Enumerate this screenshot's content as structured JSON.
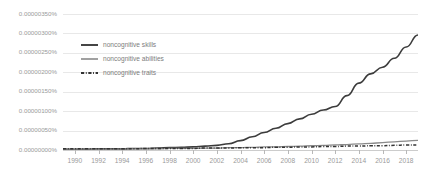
{
  "chart_data": {
    "type": "line",
    "title": "",
    "subtitle": "",
    "xlabel": "",
    "ylabel": "",
    "grid": true,
    "legend_position": "top-left-inside",
    "xlim": [
      1989,
      2019
    ],
    "ylim": [
      0.0,
      3.5e-06
    ],
    "yticks": [
      0.0,
      5e-07,
      1e-06,
      1.5e-06,
      2e-06,
      2.5e-06,
      3e-06,
      3.5e-06
    ],
    "ytick_labels": [
      "0.00000000%",
      "0.00000050%",
      "0.00000100%",
      "0.00000150%",
      "0.00000200%",
      "0.00000250%",
      "0.00000300%",
      "0.00000350%"
    ],
    "xticks": [
      1990,
      1992,
      1994,
      1996,
      1998,
      2000,
      2002,
      2004,
      2006,
      2008,
      2010,
      2012,
      2014,
      2016,
      2018
    ],
    "xtick_labels": [
      "1990",
      "1992",
      "1994",
      "1996",
      "1998",
      "2000",
      "2002",
      "2004",
      "2006",
      "2008",
      "2010",
      "2012",
      "2014",
      "2016",
      "2018"
    ],
    "x": [
      1989,
      1990,
      1991,
      1992,
      1993,
      1994,
      1995,
      1996,
      1997,
      1998,
      1999,
      2000,
      2001,
      2002,
      2003,
      2004,
      2005,
      2006,
      2007,
      2008,
      2009,
      2010,
      2011,
      2012,
      2013,
      2014,
      2015,
      2016,
      2017,
      2018,
      2019
    ],
    "series": [
      {
        "name": "noncognitive skills",
        "color": "#3c3c3c",
        "width": 1.6,
        "dash": "none",
        "values": [
          2e-08,
          2e-08,
          2e-08,
          3e-08,
          3e-08,
          3e-08,
          4e-08,
          4e-08,
          5e-08,
          6e-08,
          7e-08,
          8e-08,
          1e-07,
          1.2e-07,
          1.6e-07,
          2.4e-07,
          3.4e-07,
          4.5e-07,
          5.6e-07,
          6.8e-07,
          8e-07,
          9.2e-07,
          1.03e-06,
          1.12e-06,
          1.4e-06,
          1.72e-06,
          1.96e-06,
          2.13e-06,
          2.36e-06,
          2.65e-06,
          2.96e-06
        ]
      },
      {
        "name": "noncognitive abilities",
        "color": "#8a8a8a",
        "width": 1.3,
        "dash": "none",
        "values": [
          2e-08,
          2e-08,
          2e-08,
          2e-08,
          2e-08,
          3e-08,
          3e-08,
          3e-08,
          3e-08,
          4e-08,
          4e-08,
          4e-08,
          5e-08,
          5e-08,
          6e-08,
          6e-08,
          7e-08,
          8e-08,
          8e-08,
          9e-08,
          1e-07,
          1.1e-07,
          1.2e-07,
          1.3e-07,
          1.4e-07,
          1.6e-07,
          1.7e-07,
          1.9e-07,
          2.1e-07,
          2.3e-07,
          2.5e-07
        ]
      },
      {
        "name": "noncognitive traits",
        "color": "#333333",
        "width": 1.5,
        "dash": "3.2 1.6 0.9 1.6",
        "values": [
          3e-08,
          3e-08,
          3e-08,
          3e-08,
          3e-08,
          3e-08,
          3e-08,
          4e-08,
          4e-08,
          4e-08,
          4e-08,
          4e-08,
          5e-08,
          5e-08,
          5e-08,
          6e-08,
          6e-08,
          6e-08,
          7e-08,
          7e-08,
          8e-08,
          8e-08,
          9e-08,
          9e-08,
          1e-07,
          1e-07,
          1.1e-07,
          1.1e-07,
          1.2e-07,
          1.3e-07,
          1.3e-07
        ]
      }
    ]
  },
  "legend": {
    "items": [
      {
        "label": "noncognitive skills"
      },
      {
        "label": "noncognitive abilities"
      },
      {
        "label": "noncognitive traits"
      }
    ]
  }
}
